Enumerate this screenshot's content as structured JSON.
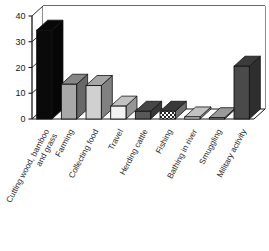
{
  "chart_data": {
    "type": "bar",
    "title": "",
    "subtitle": "",
    "xlabel": "",
    "ylabel": "",
    "ylim": [
      0,
      40
    ],
    "yticks": [
      0,
      10,
      20,
      30,
      40
    ],
    "grid": true,
    "legend": false,
    "style": "3d-column",
    "categories": [
      "Cutting wood, bamboo and grass",
      "Farming",
      "Collecting food",
      "Travel",
      "Herding cattle",
      "Fishing",
      "Bathing in river",
      "Smuggling",
      "Military activity"
    ],
    "values": [
      34.5,
      13.5,
      13,
      5,
      3,
      3,
      0.8,
      0.5,
      20.5
    ],
    "bar_fills": [
      "#0a0a0a",
      "#a8a8a8",
      "#d0d0d0",
      "#f2f2f2",
      "#585858",
      "checkered",
      "#f2f2f2",
      "#bfbfbf",
      "#4a4a4a"
    ]
  },
  "axis": {
    "y_tick_labels": [
      "40",
      "30",
      "20",
      "10",
      "0"
    ]
  },
  "colors": {
    "background": "#ffffff",
    "axis": "#1a1a1a",
    "grid": "#6b6b6b",
    "floor": "#ffffff",
    "text": "#1a1a1a"
  }
}
